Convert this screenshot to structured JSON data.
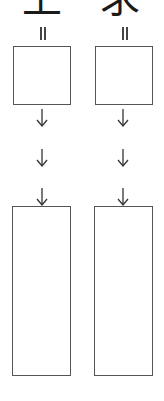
{
  "header": {
    "left_char": "上",
    "right_char": "求"
  },
  "columns": [
    {
      "equals_marker": "=",
      "top_box": "",
      "arrows": [
        "↓",
        "↓",
        "↓"
      ],
      "bottom_box": ""
    },
    {
      "equals_marker": "=",
      "top_box": "",
      "arrows": [
        "↓",
        "↓",
        "↓"
      ],
      "bottom_box": ""
    }
  ],
  "colors": {
    "border": "#555555",
    "text": "#1a1a1a",
    "background": "#ffffff"
  }
}
